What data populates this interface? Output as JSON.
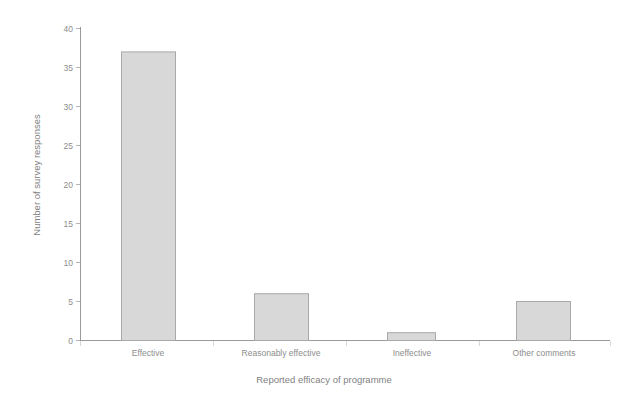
{
  "chart_data": {
    "type": "bar",
    "title": "",
    "subtitle": "",
    "xlabel": "Reported efficacy of programme",
    "ylabel": "Number of survey responses",
    "categories": [
      "Effective",
      "Reasonably effective",
      "Ineffective",
      "Other comments"
    ],
    "values": [
      37,
      6,
      1,
      5
    ],
    "ylim": [
      0,
      40
    ],
    "ytick_labels": [
      "0",
      "5",
      "10",
      "15",
      "20",
      "25",
      "30",
      "35",
      "40"
    ],
    "ytick_values": [
      0,
      5,
      10,
      15,
      20,
      25,
      30,
      35,
      40
    ],
    "grid": false,
    "legend": null,
    "legend_position": "none",
    "annotations": [],
    "colors": {
      "bar_fill": "#d8d8d8",
      "bar_stroke": "#a9a9a9",
      "axis": "#9a9a9a",
      "text": "#8d8d8d",
      "background": "#ffffff"
    }
  },
  "axes": {
    "y_title": "Number of survey responses",
    "x_title": "Reported efficacy of programme"
  },
  "ticks": {
    "y": [
      {
        "label": "40",
        "value": 40
      },
      {
        "label": "35",
        "value": 35
      },
      {
        "label": "30",
        "value": 30
      },
      {
        "label": "25",
        "value": 25
      },
      {
        "label": "20",
        "value": 20
      },
      {
        "label": "15",
        "value": 15
      },
      {
        "label": "10",
        "value": 10
      },
      {
        "label": "5",
        "value": 5
      },
      {
        "label": "0",
        "value": 0
      }
    ]
  },
  "bars": [
    {
      "label": "Effective",
      "value": 37
    },
    {
      "label": "Reasonably effective",
      "value": 6
    },
    {
      "label": "Ineffective",
      "value": 1
    },
    {
      "label": "Other comments",
      "value": 5
    }
  ]
}
